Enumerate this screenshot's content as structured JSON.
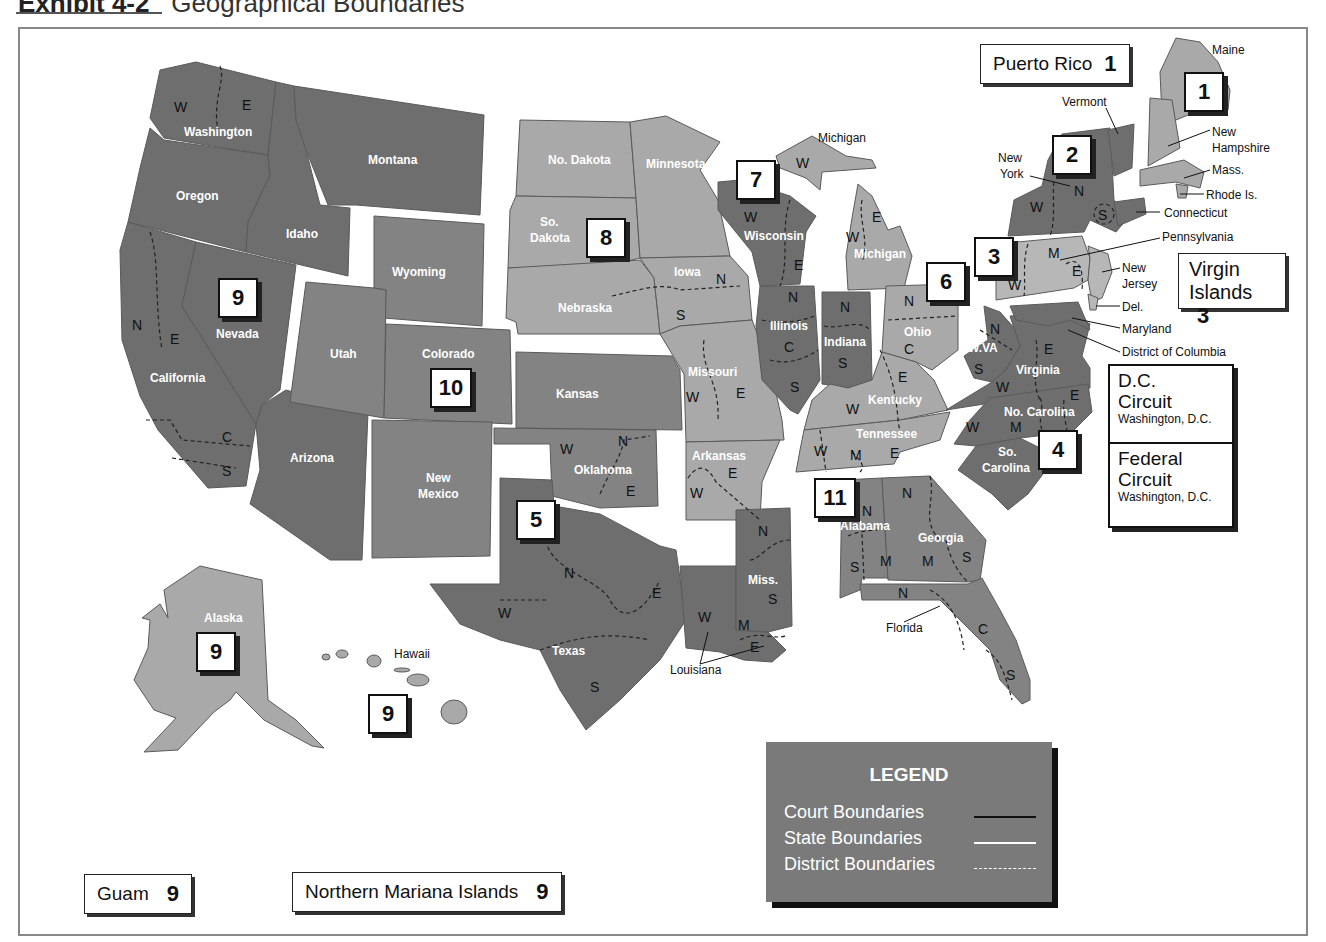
{
  "header": {
    "exhibit_label": "Exhibit 4-2",
    "title": "Geographical Boundaries"
  },
  "colors": {
    "dark_gray": "#6e6e6e",
    "medium_gray": "#838383",
    "light_gray": "#a9a9a9",
    "lighter_gray": "#b7b7b7",
    "background": "#ffffff",
    "legend_bg": "#7a7a7a"
  },
  "circuits": [
    {
      "number": "1",
      "label": "1"
    },
    {
      "number": "2",
      "label": "2"
    },
    {
      "number": "3",
      "label": "3"
    },
    {
      "number": "4",
      "label": "4"
    },
    {
      "number": "5",
      "label": "5"
    },
    {
      "number": "6",
      "label": "6"
    },
    {
      "number": "7",
      "label": "7"
    },
    {
      "number": "8",
      "label": "8"
    },
    {
      "number": "9",
      "label": "9"
    },
    {
      "number": "10",
      "label": "10"
    },
    {
      "number": "11",
      "label": "11"
    }
  ],
  "states": {
    "washington": "Washington",
    "oregon": "Oregon",
    "idaho": "Idaho",
    "montana": "Montana",
    "california": "California",
    "nevada": "Nevada",
    "arizona": "Arizona",
    "alaska": "Alaska",
    "hawaii": "Hawaii",
    "wyoming": "Wyoming",
    "utah": "Utah",
    "colorado": "Colorado",
    "kansas": "Kansas",
    "new_mexico_1": "New",
    "new_mexico_2": "Mexico",
    "oklahoma": "Oklahoma",
    "no_dakota": "No. Dakota",
    "so_dakota_1": "So.",
    "so_dakota_2": "Dakota",
    "nebraska": "Nebraska",
    "minnesota": "Minnesota",
    "iowa": "Iowa",
    "missouri": "Missouri",
    "arkansas": "Arkansas",
    "texas": "Texas",
    "louisiana": "Louisiana",
    "miss": "Miss.",
    "wisconsin": "Wisconsin",
    "illinois": "Illinois",
    "indiana": "Indiana",
    "michigan_upper": "Michigan",
    "michigan_lower": "Michigan",
    "ohio": "Ohio",
    "kentucky": "Kentucky",
    "tennessee": "Tennessee",
    "alabama": "Alabama",
    "georgia": "Georgia",
    "florida": "Florida",
    "wva": "W.VA",
    "virginia": "Virginia",
    "no_carolina": "No. Carolina",
    "so_carolina_1": "So.",
    "so_carolina_2": "Carolina",
    "new_york_1": "New",
    "new_york_2": "York",
    "vermont": "Vermont",
    "maine": "Maine",
    "new_hampshire_1": "New",
    "new_hampshire_2": "Hampshire",
    "mass": "Mass.",
    "rhode_is": "Rhode Is.",
    "connecticut": "Connecticut",
    "pennsylvania": "Pennsylvania",
    "new_jersey_1": "New",
    "new_jersey_2": "Jersey",
    "del": "Del.",
    "maryland": "Maryland",
    "dc": "District of Columbia"
  },
  "districts": {
    "W": "W",
    "E": "E",
    "N": "N",
    "S": "S",
    "C": "C",
    "M": "M"
  },
  "territories": {
    "puerto_rico": {
      "name": "Puerto Rico",
      "circuit": "1"
    },
    "virgin_islands": {
      "name_1": "Virgin",
      "name_2": "Islands",
      "circuit": "3"
    },
    "guam": {
      "name": "Guam",
      "circuit": "9"
    },
    "northern_mariana": {
      "name": "Northern Mariana Islands",
      "circuit": "9"
    }
  },
  "special_circuits": {
    "dc": {
      "name_1": "D.C.",
      "name_2": "Circuit",
      "location": "Washington, D.C."
    },
    "federal": {
      "name_1": "Federal",
      "name_2": "Circuit",
      "location": "Washington, D.C."
    }
  },
  "legend": {
    "title": "LEGEND",
    "items": [
      {
        "label": "Court Boundaries",
        "style": "solid-black"
      },
      {
        "label": "State Boundaries",
        "style": "solid-white"
      },
      {
        "label": "District Boundaries",
        "style": "dashed-white"
      }
    ]
  }
}
